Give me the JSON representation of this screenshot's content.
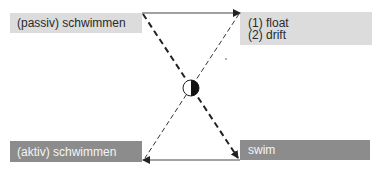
{
  "diagram": {
    "nodes": {
      "top_left": {
        "label": "(passiv) schwimmen"
      },
      "top_right": {
        "lines": [
          "(1) float",
          "(2) drift"
        ]
      },
      "bottom_left": {
        "label": "(aktiv) schwimmen"
      },
      "bottom_right": {
        "label": "swim"
      }
    },
    "edges": [
      {
        "from": "top_left",
        "to": "top_right",
        "style": "solid",
        "arrow": "end"
      },
      {
        "from": "bottom_right",
        "to": "bottom_left",
        "style": "solid",
        "arrow": "end"
      },
      {
        "from": "top_left",
        "to": "bottom_right",
        "style": "thick-dashed",
        "arrow": "end"
      },
      {
        "from": "top_right",
        "to": "bottom_left",
        "style": "thin-dashed",
        "arrow": "end"
      }
    ],
    "center_symbol": {
      "type": "half-filled-circle",
      "left_fill": "#ffffff",
      "right_fill": "#111111"
    },
    "colors": {
      "light_box": "#dcdcdc",
      "dark_box": "#8c8c8c",
      "line": "#222222"
    }
  }
}
